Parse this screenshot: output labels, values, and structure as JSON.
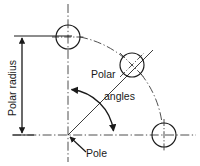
{
  "diagram": {
    "type": "technical-drawing",
    "background_color": "#ffffff",
    "line_color": "#1a1a1a",
    "centerline_color": "#4a4a4a",
    "canvas": {
      "width": 200,
      "height": 166
    },
    "labels": {
      "polar_radius": "Polar radius",
      "polar_angles_line1": "Polar",
      "polar_angles_line2": "angles",
      "pole": "Pole"
    },
    "geometry": {
      "pole": {
        "x": 68,
        "y": 135
      },
      "horizontal_axis": {
        "x1": 12,
        "y1": 135,
        "x2": 196,
        "y2": 135
      },
      "vertical_axis": {
        "x1": 68,
        "y1": 4,
        "x2": 68,
        "y2": 162
      },
      "polar_radius_value": 99,
      "dimension_line": {
        "x": 22,
        "y_top": 36,
        "y_bottom": 135
      },
      "extension_line_top": {
        "x1": 14,
        "y1": 36,
        "x2": 70,
        "y2": 36
      },
      "extension_line_bottom": {
        "x1": 14,
        "y1": 135,
        "x2": 30,
        "y2": 135
      },
      "angle_arc": {
        "center_x": 68,
        "center_y": 135,
        "radius": 48
      },
      "angle_ray": {
        "x1": 68,
        "y1": 135,
        "x2": 152,
        "y2": 51
      },
      "bolt_circle_radius": 99,
      "holes": [
        {
          "id": "hole-top",
          "cx": 68,
          "cy": 37,
          "r": 12,
          "angle_deg": 90,
          "crosshair": "orthogonal"
        },
        {
          "id": "hole-middle",
          "cx": 132,
          "cy": 65,
          "r": 12,
          "angle_deg": 45,
          "crosshair": "diagonal"
        },
        {
          "id": "hole-bottom",
          "cx": 164,
          "cy": 135,
          "r": 12,
          "angle_deg": 0,
          "crosshair": "orthogonal"
        }
      ]
    }
  }
}
